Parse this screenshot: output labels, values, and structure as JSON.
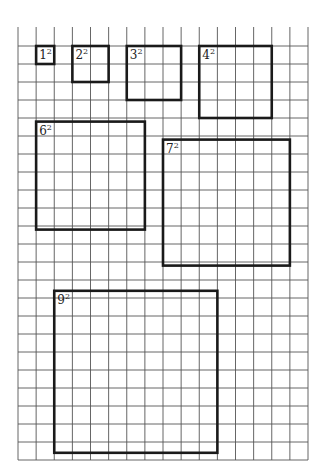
{
  "diagram": {
    "type": "grid-squares",
    "grid": {
      "x0": 18,
      "y0": 46,
      "cell_w": 18.125,
      "cell_h": 18,
      "cols": 16,
      "rows": 23,
      "top_extension_y": 27,
      "line_color": "#555555"
    },
    "box_color": "#1a1a1a",
    "squares": [
      {
        "id": "sq1",
        "base": "1",
        "exp": "2",
        "side": 1,
        "col": 1,
        "row": 0
      },
      {
        "id": "sq2",
        "base": "2",
        "exp": "2",
        "side": 2,
        "col": 3,
        "row": 0
      },
      {
        "id": "sq3",
        "base": "3",
        "exp": "2",
        "side": 3,
        "col": 6,
        "row": 0
      },
      {
        "id": "sq4",
        "base": "4",
        "exp": "2",
        "side": 4,
        "col": 10,
        "row": 0
      },
      {
        "id": "sq6",
        "base": "6",
        "exp": "2",
        "side": 6,
        "col": 1,
        "row": 4.2
      },
      {
        "id": "sq7",
        "base": "7",
        "exp": "2",
        "side": 7,
        "col": 8,
        "row": 5.2
      },
      {
        "id": "sq9",
        "base": "9",
        "exp": "2",
        "side": 9,
        "col": 2,
        "row": 13.6
      }
    ]
  }
}
